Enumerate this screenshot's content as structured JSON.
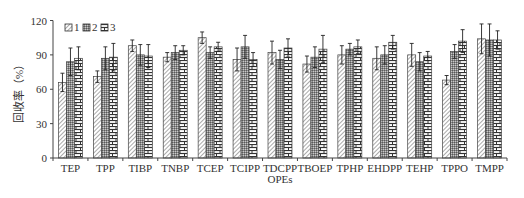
{
  "chart_data": {
    "type": "bar",
    "title": "",
    "xlabel": "OPEs",
    "ylabel": "回收率（%）",
    "ylim": [
      0,
      120
    ],
    "yticks": [
      0,
      30,
      60,
      90,
      120
    ],
    "grid": false,
    "legend_position": "top-left",
    "categories": [
      "TEP",
      "TPP",
      "TIBP",
      "TNBP",
      "TCEP",
      "TCIPP",
      "TDCPP",
      "TBOEP",
      "TPHP",
      "EHDPP",
      "TEHP",
      "TPPO",
      "TMPP"
    ],
    "series": [
      {
        "name": "1",
        "pattern": "diagonal-hatch",
        "values": [
          66,
          71,
          98,
          88,
          105,
          86,
          92,
          82,
          90,
          87,
          90,
          68,
          104
        ],
        "errors": [
          8,
          5,
          5,
          4,
          5,
          10,
          10,
          7,
          8,
          10,
          10,
          4,
          13
        ]
      },
      {
        "name": "2",
        "pattern": "dense-crosshatch",
        "values": [
          84,
          87,
          90,
          92,
          92,
          97,
          86,
          88,
          95,
          90,
          84,
          93,
          103
        ],
        "errors": [
          12,
          10,
          9,
          6,
          5,
          10,
          8,
          9,
          5,
          8,
          8,
          6,
          14
        ]
      },
      {
        "name": "3",
        "pattern": "brick",
        "values": [
          87,
          88,
          89,
          94,
          97,
          86,
          96,
          95,
          97,
          101,
          89,
          102,
          103
        ],
        "errors": [
          10,
          12,
          10,
          4,
          4,
          6,
          8,
          12,
          6,
          6,
          4,
          10,
          8
        ]
      }
    ]
  },
  "legend": {
    "items": [
      {
        "label": "1"
      },
      {
        "label": "2"
      },
      {
        "label": "3"
      }
    ]
  },
  "axes": {
    "x_title": "OPEs",
    "y_title": "回收率（%）"
  }
}
